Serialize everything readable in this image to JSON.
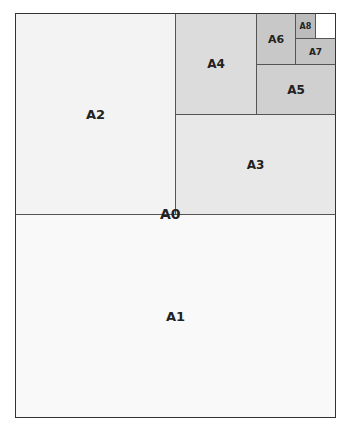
{
  "diagram": {
    "sheets": [
      {
        "id": "a0",
        "label": "A0"
      },
      {
        "id": "a1",
        "label": "A1"
      },
      {
        "id": "a2",
        "label": "A2"
      },
      {
        "id": "a3",
        "label": "A3"
      },
      {
        "id": "a4",
        "label": "A4"
      },
      {
        "id": "a5",
        "label": "A5"
      },
      {
        "id": "a6",
        "label": "A6"
      },
      {
        "id": "a7",
        "label": "A7"
      },
      {
        "id": "a8",
        "label": "A8"
      }
    ]
  }
}
